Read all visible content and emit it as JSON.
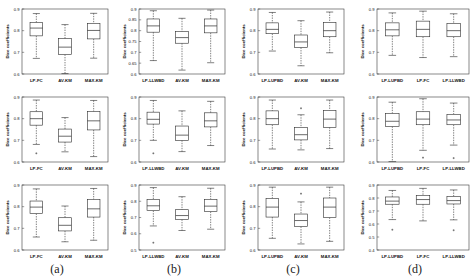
{
  "figure": {
    "columns": [
      {
        "id": "a",
        "label": "(a)"
      },
      {
        "id": "b",
        "label": "(b)"
      },
      {
        "id": "c",
        "label": "(c)"
      },
      {
        "id": "d",
        "label": "(d)"
      }
    ]
  },
  "chart_data": [
    {
      "panel_id": "a1",
      "column": "a",
      "row": 1,
      "type": "box",
      "title": "",
      "xlabel": "",
      "ylabel": "Dice coefficients",
      "ylim": [
        0.6,
        0.9
      ],
      "yticks": [
        0.6,
        0.7,
        0.8,
        0.9
      ],
      "ytick_labels": [
        "0.6",
        "0.7",
        "0.8",
        "0.9"
      ],
      "grid": false,
      "legend": "none",
      "categories": [
        "LP-FC",
        "AV-KM",
        "MAX-KM"
      ],
      "boxes": [
        {
          "category": "LP-FC",
          "whisker_low": 0.672,
          "q1": 0.776,
          "median": 0.812,
          "q3": 0.838,
          "whisker_high": 0.879,
          "outliers": []
        },
        {
          "category": "AV-KM",
          "whisker_low": 0.602,
          "q1": 0.69,
          "median": 0.724,
          "q3": 0.763,
          "whisker_high": 0.828,
          "outliers": []
        },
        {
          "category": "MAX-KM",
          "whisker_low": 0.673,
          "q1": 0.762,
          "median": 0.801,
          "q3": 0.834,
          "whisker_high": 0.88,
          "outliers": []
        }
      ]
    },
    {
      "panel_id": "a2",
      "column": "a",
      "row": 2,
      "type": "box",
      "title": "",
      "xlabel": "",
      "ylabel": "Dice coefficients",
      "ylim": [
        0.6,
        0.9
      ],
      "yticks": [
        0.6,
        0.7,
        0.8,
        0.9
      ],
      "ytick_labels": [
        "0.6",
        "0.7",
        "0.8",
        "0.9"
      ],
      "grid": false,
      "legend": "none",
      "categories": [
        "LP-FC",
        "AV-KM",
        "MAX-KM"
      ],
      "boxes": [
        {
          "category": "LP-FC",
          "whisker_low": 0.681,
          "q1": 0.77,
          "median": 0.8,
          "q3": 0.832,
          "whisker_high": 0.886,
          "outliers": [
            0.64
          ]
        },
        {
          "category": "AV-KM",
          "whisker_low": 0.647,
          "q1": 0.692,
          "median": 0.719,
          "q3": 0.752,
          "whisker_high": 0.805,
          "outliers": []
        },
        {
          "category": "MAX-KM",
          "whisker_low": 0.625,
          "q1": 0.748,
          "median": 0.79,
          "q3": 0.833,
          "whisker_high": 0.884,
          "outliers": []
        }
      ]
    },
    {
      "panel_id": "a3",
      "column": "a",
      "row": 3,
      "type": "box",
      "title": "",
      "xlabel": "",
      "ylabel": "Dice coefficients",
      "ylim": [
        0.6,
        0.9
      ],
      "yticks": [
        0.6,
        0.7,
        0.8,
        0.9
      ],
      "ytick_labels": [
        "0.6",
        "0.7",
        "0.8",
        "0.9"
      ],
      "grid": false,
      "legend": "none",
      "categories": [
        "LP-FC",
        "AV-KM",
        "MAX-KM"
      ],
      "boxes": [
        {
          "category": "LP-FC",
          "whisker_low": 0.66,
          "q1": 0.768,
          "median": 0.798,
          "q3": 0.826,
          "whisker_high": 0.882,
          "outliers": []
        },
        {
          "category": "AV-KM",
          "whisker_low": 0.638,
          "q1": 0.688,
          "median": 0.714,
          "q3": 0.749,
          "whisker_high": 0.803,
          "outliers": []
        },
        {
          "category": "MAX-KM",
          "whisker_low": 0.645,
          "q1": 0.752,
          "median": 0.79,
          "q3": 0.833,
          "whisker_high": 0.884,
          "outliers": []
        }
      ]
    },
    {
      "panel_id": "b1",
      "column": "b",
      "row": 1,
      "type": "box",
      "title": "",
      "xlabel": "",
      "ylabel": "Dice coefficients",
      "ylim": [
        0.6,
        0.9
      ],
      "yticks": [
        0.6,
        0.65,
        0.7,
        0.75,
        0.8,
        0.85,
        0.9
      ],
      "ytick_labels": [
        "0.6",
        "0.65",
        "0.7",
        "0.75",
        "0.8",
        "0.85",
        "0.9"
      ],
      "grid": false,
      "legend": "none",
      "categories": [
        "LP-LLWBD",
        "AV-KM",
        "MAX-KM"
      ],
      "boxes": [
        {
          "category": "LP-LLWBD",
          "whisker_low": 0.662,
          "q1": 0.793,
          "median": 0.822,
          "q3": 0.854,
          "whisker_high": 0.892,
          "outliers": []
        },
        {
          "category": "AV-KM",
          "whisker_low": 0.618,
          "q1": 0.742,
          "median": 0.768,
          "q3": 0.796,
          "whisker_high": 0.857,
          "outliers": []
        },
        {
          "category": "MAX-KM",
          "whisker_low": 0.652,
          "q1": 0.79,
          "median": 0.822,
          "q3": 0.854,
          "whisker_high": 0.895,
          "outliers": []
        }
      ]
    },
    {
      "panel_id": "b2",
      "column": "b",
      "row": 2,
      "type": "box",
      "title": "",
      "xlabel": "",
      "ylabel": "Dice coefficients",
      "ylim": [
        0.6,
        0.9
      ],
      "yticks": [
        0.6,
        0.7,
        0.8,
        0.9
      ],
      "ytick_labels": [
        "0.6",
        "0.7",
        "0.8",
        "0.9"
      ],
      "grid": false,
      "legend": "none",
      "categories": [
        "LP-LLWBD",
        "AV-KM",
        "MAX-KM"
      ],
      "boxes": [
        {
          "category": "LP-LLWBD",
          "whisker_low": 0.7,
          "q1": 0.775,
          "median": 0.797,
          "q3": 0.83,
          "whisker_high": 0.884,
          "outliers": [
            0.64
          ]
        },
        {
          "category": "AV-KM",
          "whisker_low": 0.648,
          "q1": 0.7,
          "median": 0.724,
          "q3": 0.766,
          "whisker_high": 0.836,
          "outliers": []
        },
        {
          "category": "MAX-KM",
          "whisker_low": 0.676,
          "q1": 0.762,
          "median": 0.79,
          "q3": 0.827,
          "whisker_high": 0.88,
          "outliers": []
        }
      ]
    },
    {
      "panel_id": "b3",
      "column": "b",
      "row": 3,
      "type": "box",
      "title": "",
      "xlabel": "",
      "ylabel": "Dice coefficients",
      "ylim": [
        0.5,
        0.9
      ],
      "yticks": [
        0.5,
        0.6,
        0.7,
        0.8,
        0.9
      ],
      "ytick_labels": [
        "0.5",
        "0.6",
        "0.7",
        "0.8",
        "0.9"
      ],
      "grid": false,
      "legend": "none",
      "categories": [
        "LP-LLWBD",
        "AV-KM",
        "MAX-KM"
      ],
      "boxes": [
        {
          "category": "LP-LLWBD",
          "whisker_low": 0.648,
          "q1": 0.742,
          "median": 0.772,
          "q3": 0.812,
          "whisker_high": 0.884,
          "outliers": [
            0.545
          ]
        },
        {
          "category": "AV-KM",
          "whisker_low": 0.62,
          "q1": 0.688,
          "median": 0.712,
          "q3": 0.748,
          "whisker_high": 0.828,
          "outliers": []
        },
        {
          "category": "MAX-KM",
          "whisker_low": 0.628,
          "q1": 0.736,
          "median": 0.77,
          "q3": 0.812,
          "whisker_high": 0.88,
          "outliers": []
        }
      ]
    },
    {
      "panel_id": "c1",
      "column": "c",
      "row": 1,
      "type": "box",
      "title": "",
      "xlabel": "",
      "ylabel": "Dice coefficients",
      "ylim": [
        0.6,
        0.9
      ],
      "yticks": [
        0.6,
        0.7,
        0.8,
        0.9
      ],
      "ytick_labels": [
        "0.6",
        "0.7",
        "0.8",
        "0.9"
      ],
      "grid": false,
      "legend": "none",
      "categories": [
        "LP-LUPBD",
        "AV-KM",
        "MAX-KM"
      ],
      "boxes": [
        {
          "category": "LP-LUPBD",
          "whisker_low": 0.706,
          "q1": 0.786,
          "median": 0.806,
          "q3": 0.836,
          "whisker_high": 0.884,
          "outliers": []
        },
        {
          "category": "AV-KM",
          "whisker_low": 0.638,
          "q1": 0.722,
          "median": 0.748,
          "q3": 0.78,
          "whisker_high": 0.846,
          "outliers": []
        },
        {
          "category": "MAX-KM",
          "whisker_low": 0.698,
          "q1": 0.772,
          "median": 0.8,
          "q3": 0.838,
          "whisker_high": 0.886,
          "outliers": []
        }
      ]
    },
    {
      "panel_id": "c2",
      "column": "c",
      "row": 2,
      "type": "box",
      "title": "",
      "xlabel": "",
      "ylabel": "Dice coefficients",
      "ylim": [
        0.6,
        0.9
      ],
      "yticks": [
        0.6,
        0.7,
        0.8,
        0.9
      ],
      "ytick_labels": [
        "0.6",
        "0.7",
        "0.8",
        "0.9"
      ],
      "grid": false,
      "legend": "none",
      "categories": [
        "LP-LUPBD",
        "AV-KM",
        "MAX-KM"
      ],
      "boxes": [
        {
          "category": "LP-LUPBD",
          "whisker_low": 0.66,
          "q1": 0.772,
          "median": 0.8,
          "q3": 0.836,
          "whisker_high": 0.886,
          "outliers": []
        },
        {
          "category": "AV-KM",
          "whisker_low": 0.656,
          "q1": 0.702,
          "median": 0.726,
          "q3": 0.76,
          "whisker_high": 0.818,
          "outliers": [
            0.848
          ]
        },
        {
          "category": "MAX-KM",
          "whisker_low": 0.662,
          "q1": 0.76,
          "median": 0.798,
          "q3": 0.838,
          "whisker_high": 0.886,
          "outliers": []
        }
      ]
    },
    {
      "panel_id": "c3",
      "column": "c",
      "row": 3,
      "type": "box",
      "title": "",
      "xlabel": "",
      "ylabel": "Dice coefficients",
      "ylim": [
        0.6,
        0.9
      ],
      "yticks": [
        0.6,
        0.7,
        0.8,
        0.9
      ],
      "ytick_labels": [
        "0.6",
        "0.7",
        "0.8",
        "0.9"
      ],
      "grid": false,
      "legend": "none",
      "categories": [
        "LP-LUPBD",
        "AV-KM",
        "MAX-KM"
      ],
      "boxes": [
        {
          "category": "LP-LUPBD",
          "whisker_low": 0.654,
          "q1": 0.752,
          "median": 0.798,
          "q3": 0.838,
          "whisker_high": 0.89,
          "outliers": []
        },
        {
          "category": "AV-KM",
          "whisker_low": 0.628,
          "q1": 0.708,
          "median": 0.736,
          "q3": 0.766,
          "whisker_high": 0.822,
          "outliers": [
            0.86
          ]
        },
        {
          "category": "MAX-KM",
          "whisker_low": 0.64,
          "q1": 0.75,
          "median": 0.798,
          "q3": 0.84,
          "whisker_high": 0.89,
          "outliers": []
        }
      ]
    },
    {
      "panel_id": "d1",
      "column": "d",
      "row": 1,
      "type": "box",
      "title": "",
      "xlabel": "",
      "ylabel": "Dice coefficients",
      "ylim": [
        0.6,
        0.9
      ],
      "yticks": [
        0.6,
        0.7,
        0.8,
        0.9
      ],
      "ytick_labels": [
        "0.6",
        "0.7",
        "0.8",
        "0.9"
      ],
      "grid": false,
      "legend": "none",
      "categories": [
        "LP-LUPBD",
        "LP-FC",
        "LP-LLWBD"
      ],
      "boxes": [
        {
          "category": "LP-LUPBD",
          "whisker_low": 0.686,
          "q1": 0.776,
          "median": 0.804,
          "q3": 0.836,
          "whisker_high": 0.882,
          "outliers": []
        },
        {
          "category": "LP-FC",
          "whisker_low": 0.676,
          "q1": 0.772,
          "median": 0.806,
          "q3": 0.844,
          "whisker_high": 0.89,
          "outliers": []
        },
        {
          "category": "LP-LLWBD",
          "whisker_low": 0.68,
          "q1": 0.772,
          "median": 0.8,
          "q3": 0.834,
          "whisker_high": 0.878,
          "outliers": []
        }
      ]
    },
    {
      "panel_id": "d2",
      "column": "d",
      "row": 2,
      "type": "box",
      "title": "",
      "xlabel": "",
      "ylabel": "Dice coefficients",
      "ylim": [
        0.6,
        0.9
      ],
      "yticks": [
        0.6,
        0.7,
        0.8,
        0.9
      ],
      "ytick_labels": [
        "0.6",
        "0.7",
        "0.8",
        "0.9"
      ],
      "grid": false,
      "legend": "none",
      "categories": [
        "LP-LUPBD",
        "LP-FC",
        "LP-LLWBD"
      ],
      "boxes": [
        {
          "category": "LP-LUPBD",
          "whisker_low": 0.602,
          "q1": 0.764,
          "median": 0.788,
          "q3": 0.824,
          "whisker_high": 0.876,
          "outliers": []
        },
        {
          "category": "LP-FC",
          "whisker_low": 0.654,
          "q1": 0.772,
          "median": 0.798,
          "q3": 0.832,
          "whisker_high": 0.892,
          "outliers": [
            0.62
          ]
        },
        {
          "category": "LP-LLWBD",
          "whisker_low": 0.678,
          "q1": 0.772,
          "median": 0.794,
          "q3": 0.82,
          "whisker_high": 0.872,
          "outliers": [
            0.618
          ]
        }
      ]
    },
    {
      "panel_id": "d3",
      "column": "d",
      "row": 3,
      "type": "box",
      "title": "",
      "xlabel": "",
      "ylabel": "Dice coefficients",
      "ylim": [
        0.4,
        0.9
      ],
      "yticks": [
        0.4,
        0.5,
        0.6,
        0.7,
        0.8,
        0.9
      ],
      "ytick_labels": [
        "0.4",
        "0.5",
        "0.6",
        "0.7",
        "0.8",
        "0.9"
      ],
      "grid": false,
      "legend": "none",
      "categories": [
        "LP-LUPBD",
        "LP-FC",
        "LP-LLWBD"
      ],
      "boxes": [
        {
          "category": "LP-LUPBD",
          "whisker_low": 0.634,
          "q1": 0.752,
          "median": 0.776,
          "q3": 0.808,
          "whisker_high": 0.858,
          "outliers": [
            0.556
          ]
        },
        {
          "category": "LP-FC",
          "whisker_low": 0.624,
          "q1": 0.752,
          "median": 0.788,
          "q3": 0.818,
          "whisker_high": 0.874,
          "outliers": []
        },
        {
          "category": "LP-LLWBD",
          "whisker_low": 0.632,
          "q1": 0.754,
          "median": 0.78,
          "q3": 0.812,
          "whisker_high": 0.862,
          "outliers": [
            0.552
          ]
        }
      ]
    }
  ]
}
